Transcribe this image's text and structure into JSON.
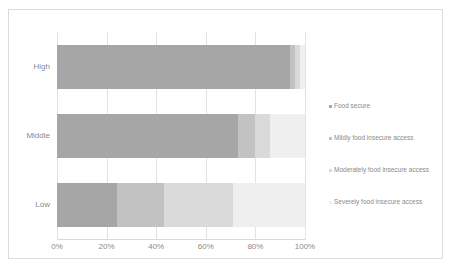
{
  "chart_data": {
    "type": "bar",
    "orientation": "horizontal",
    "stacked": true,
    "stack_mode": "percent",
    "title": "",
    "subtitle": "",
    "xlabel": "",
    "ylabel": "",
    "categories": [
      "High",
      "Middle",
      "Low"
    ],
    "x_tick_labels": [
      "0%",
      "20%",
      "40%",
      "60%",
      "80%",
      "100%"
    ],
    "x_tick_values": [
      0,
      20,
      40,
      60,
      80,
      100
    ],
    "xlim": [
      0,
      100
    ],
    "grid": true,
    "grid_axis": "x",
    "legend_position": "right",
    "series": [
      {
        "name": "Food secure",
        "color": "#a6a6a6",
        "values": [
          94,
          73,
          24
        ]
      },
      {
        "name": "Mildly food insecure access",
        "color": "#c2c2c2",
        "values": [
          2,
          7,
          19
        ]
      },
      {
        "name": "Moderately food insecure access",
        "color": "#dadada",
        "values": [
          2,
          6,
          28
        ]
      },
      {
        "name": "Severely food insecure access",
        "color": "#efefef",
        "values": [
          2,
          14,
          29
        ]
      }
    ]
  },
  "legend": {
    "items": [
      {
        "label": "Food secure"
      },
      {
        "label": "Mildly food insecure access"
      },
      {
        "label": "Moderately food insecure access"
      },
      {
        "label": "Severely food insecure access"
      }
    ]
  }
}
